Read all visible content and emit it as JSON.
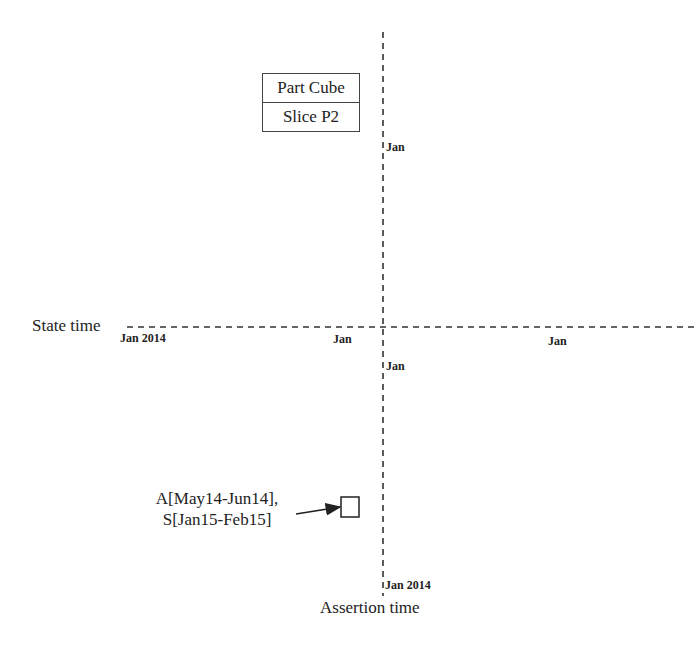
{
  "legend": {
    "title": "Part Cube",
    "subtitle": "Slice P2"
  },
  "axes": {
    "horizontal": {
      "label": "State time",
      "ticks": [
        "Jan 2014",
        "Jan",
        "Jan"
      ]
    },
    "vertical": {
      "label": "Assertion time",
      "ticks": [
        "Jan",
        "Jan",
        "Jan 2014"
      ]
    }
  },
  "data_point": {
    "label_line1": "A[May14-Jun14],",
    "label_line2": "S[Jan15-Feb15]",
    "assertion_range": "May14-Jun14",
    "state_range": "Jan15-Feb15"
  },
  "colors": {
    "line": "#333333",
    "text": "#222222"
  }
}
